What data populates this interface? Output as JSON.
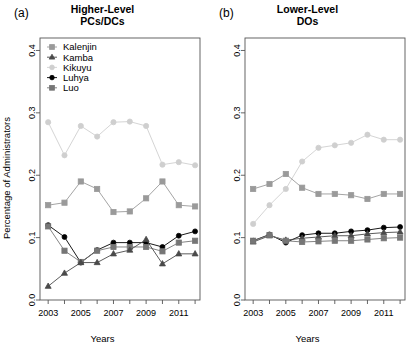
{
  "figure": {
    "ylabel": "Percentage of Administrators",
    "xlabel": "Years"
  },
  "panels": [
    {
      "letter": "(a)",
      "title": "Higher-Level\nPCs/DCs",
      "has_legend": true
    },
    {
      "letter": "(b)",
      "title": "Lower-Level\nDOs",
      "has_legend": false
    }
  ],
  "legend": {
    "items": [
      {
        "label": "Kalenjin",
        "marker": "square",
        "color": "#9a9a9a"
      },
      {
        "label": "Kamba",
        "marker": "triangle",
        "color": "#4a4a4a"
      },
      {
        "label": "Kikuyu",
        "marker": "circle",
        "color": "#cfcfcf"
      },
      {
        "label": "Luhya",
        "marker": "diamond",
        "color": "#000000"
      },
      {
        "label": "Luo",
        "marker": "square",
        "color": "#767676"
      }
    ]
  },
  "axes": {
    "xticks": [
      2003,
      2004,
      2005,
      2006,
      2007,
      2008,
      2009,
      2010,
      2011,
      2012
    ],
    "xtick_labels": [
      "2003",
      "",
      "2005",
      "",
      "2007",
      "",
      "2009",
      "",
      "2011",
      ""
    ],
    "yticks": [
      0.0,
      0.1,
      0.2,
      0.3,
      0.4
    ],
    "ytick_labels": [
      "0.0",
      "0.1",
      "0.2",
      "0.3",
      "0.4"
    ],
    "xlim": [
      2002.5,
      2012.3
    ],
    "ylim": [
      0.0,
      0.42
    ]
  },
  "chart_data": [
    {
      "type": "line",
      "panel": "(a)",
      "title": "Higher-Level PCs/DCs",
      "xlabel": "Years",
      "ylabel": "Percentage of Administrators",
      "x": [
        2003,
        2004,
        2005,
        2006,
        2007,
        2008,
        2009,
        2010,
        2011,
        2012
      ],
      "xlim": [
        2002.5,
        2012.3
      ],
      "ylim": [
        0.0,
        0.42
      ],
      "grid": false,
      "legend_position": "top-left",
      "series": [
        {
          "name": "Kikuyu",
          "marker": "circle",
          "color": "#cfcfcf",
          "values": [
            0.285,
            0.232,
            0.279,
            0.262,
            0.285,
            0.286,
            0.279,
            0.217,
            0.221,
            0.216
          ]
        },
        {
          "name": "Kalenjin",
          "marker": "square",
          "color": "#9a9a9a",
          "values": [
            0.152,
            0.156,
            0.19,
            0.178,
            0.141,
            0.142,
            0.163,
            0.19,
            0.152,
            0.15
          ]
        },
        {
          "name": "Luhya",
          "marker": "diamond",
          "color": "#000000",
          "values": [
            0.12,
            0.101,
            0.06,
            0.08,
            0.092,
            0.092,
            0.092,
            0.085,
            0.103,
            0.11
          ]
        },
        {
          "name": "Luo",
          "marker": "square",
          "color": "#767676",
          "values": [
            0.118,
            0.079,
            0.061,
            0.079,
            0.085,
            0.085,
            0.085,
            0.078,
            0.092,
            0.095
          ]
        },
        {
          "name": "Kamba",
          "marker": "triangle",
          "color": "#4a4a4a",
          "values": [
            0.022,
            0.043,
            0.06,
            0.06,
            0.074,
            0.08,
            0.097,
            0.058,
            0.074,
            0.074
          ]
        }
      ]
    },
    {
      "type": "line",
      "panel": "(b)",
      "title": "Lower-Level DOs",
      "xlabel": "Years",
      "ylabel": "Percentage of Administrators",
      "x": [
        2003,
        2004,
        2005,
        2006,
        2007,
        2008,
        2009,
        2010,
        2011,
        2012
      ],
      "xlim": [
        2002.5,
        2012.3
      ],
      "ylim": [
        0.0,
        0.42
      ],
      "grid": false,
      "legend_position": "none",
      "series": [
        {
          "name": "Kikuyu",
          "marker": "circle",
          "color": "#cfcfcf",
          "values": [
            0.122,
            0.152,
            0.178,
            0.222,
            0.244,
            0.248,
            0.252,
            0.265,
            0.257,
            0.257
          ]
        },
        {
          "name": "Kalenjin",
          "marker": "square",
          "color": "#9a9a9a",
          "values": [
            0.178,
            0.186,
            0.202,
            0.18,
            0.17,
            0.17,
            0.168,
            0.162,
            0.17,
            0.17
          ]
        },
        {
          "name": "Luhya",
          "marker": "diamond",
          "color": "#000000",
          "values": [
            0.095,
            0.105,
            0.092,
            0.104,
            0.107,
            0.107,
            0.11,
            0.112,
            0.116,
            0.117
          ]
        },
        {
          "name": "Kamba",
          "marker": "triangle",
          "color": "#4a4a4a",
          "values": [
            0.093,
            0.103,
            0.096,
            0.099,
            0.101,
            0.103,
            0.103,
            0.106,
            0.108,
            0.109
          ]
        },
        {
          "name": "Luo",
          "marker": "square",
          "color": "#767676",
          "values": [
            0.095,
            0.104,
            0.095,
            0.093,
            0.094,
            0.095,
            0.095,
            0.097,
            0.099,
            0.1
          ]
        }
      ]
    }
  ]
}
